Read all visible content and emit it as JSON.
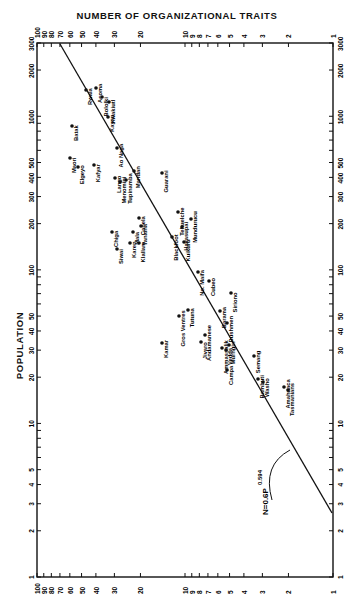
{
  "chart_data": {
    "type": "scatter",
    "title": "NUMBER OF ORGANIZATIONAL TRAITS",
    "xlabel": "NUMBER OF ORGANIZATIONAL TRAITS",
    "ylabel": "POPULATION",
    "x_scale": "log",
    "y_scale": "log",
    "x_axis_direction": "descending left-to-right",
    "xlim": [
      100,
      1
    ],
    "ylim": [
      1,
      3000
    ],
    "x_ticks": [
      100,
      90,
      80,
      70,
      60,
      50,
      40,
      30,
      20,
      10,
      9,
      8,
      7,
      6,
      5,
      4,
      3,
      2,
      1
    ],
    "y_ticks": [
      3000,
      2000,
      1000,
      900,
      800,
      700,
      600,
      500,
      400,
      300,
      200,
      100,
      90,
      80,
      70,
      60,
      50,
      40,
      30,
      20,
      10,
      9,
      8,
      7,
      6,
      5,
      4,
      3,
      2,
      1
    ],
    "grid": false,
    "regression": {
      "label": "N=0.6P^0.594",
      "equation_text": "N=0.6P",
      "exponent": "0.594"
    },
    "points": [
      {
        "name": "Batak",
        "px": 72,
        "py": 126
      },
      {
        "name": "Rwala",
        "px": 86,
        "py": 90
      },
      {
        "name": "Acoma",
        "px": 96,
        "py": 88
      },
      {
        "name": "Bololki",
        "px": 102,
        "py": 97
      },
      {
        "name": "Kwakiutl",
        "px": 109,
        "py": 102
      },
      {
        "name": "Kayan",
        "px": 108,
        "py": 117
      },
      {
        "name": "Maori",
        "px": 70,
        "py": 158
      },
      {
        "name": "Elgeyo",
        "px": 78,
        "py": 167
      },
      {
        "name": "Kafyar",
        "px": 94,
        "py": 165
      },
      {
        "name": "Ao Naga",
        "px": 117,
        "py": 148
      },
      {
        "name": "Mandan",
        "px": 134,
        "py": 171
      },
      {
        "name": "Lango",
        "px": 115,
        "py": 178
      },
      {
        "name": "Menomini",
        "px": 120,
        "py": 182
      },
      {
        "name": "Tupinamba",
        "px": 126,
        "py": 180
      },
      {
        "name": "Guarani",
        "px": 162,
        "py": 173
      },
      {
        "name": "Canela",
        "px": 139,
        "py": 218
      },
      {
        "name": "Chiga",
        "px": 112,
        "py": 232
      },
      {
        "name": "Siwai",
        "px": 117,
        "py": 249
      },
      {
        "name": "Mala",
        "px": 133,
        "py": 232
      },
      {
        "name": "Karen",
        "px": 130,
        "py": 243
      },
      {
        "name": "Klallam",
        "px": 139,
        "py": 243
      },
      {
        "name": "Tanaina",
        "px": 141,
        "py": 226
      },
      {
        "name": "Tehuelche",
        "px": 178,
        "py": 212
      },
      {
        "name": "Havasupai",
        "px": 182,
        "py": 227
      },
      {
        "name": "Mundurucu",
        "px": 191,
        "py": 219
      },
      {
        "name": "Kuikuru",
        "px": 184,
        "py": 242
      },
      {
        "name": "Blackfoot",
        "px": 172,
        "py": 237
      },
      {
        "name": "No. Maifa",
        "px": 198,
        "py": 272
      },
      {
        "name": "Cubeo",
        "px": 209,
        "py": 281
      },
      {
        "name": "Barama",
        "px": 220,
        "py": 311
      },
      {
        "name": "Siriono",
        "px": 231,
        "py": 293
      },
      {
        "name": "Bushmen",
        "px": 227,
        "py": 323
      },
      {
        "name": "Kamar",
        "px": 162,
        "py": 343
      },
      {
        "name": "Gros Ventres",
        "px": 179,
        "py": 316
      },
      {
        "name": "Tutuna",
        "px": 188,
        "py": 310
      },
      {
        "name": "Semang",
        "px": 254,
        "py": 356
      },
      {
        "name": "Bambuti",
        "px": 258,
        "py": 379
      },
      {
        "name": "Washo",
        "px": 263,
        "py": 382
      },
      {
        "name": "Amahuaca",
        "px": 284,
        "py": 387
      },
      {
        "name": "Tasmanians",
        "px": 288,
        "py": 390
      },
      {
        "name": "Andamanese",
        "px": 205,
        "py": 335
      },
      {
        "name": "Jivaro",
        "px": 201,
        "py": 342
      },
      {
        "name": "Ammassalik",
        "px": 222,
        "py": 348
      },
      {
        "name": "Vedda",
        "px": 226,
        "py": 350
      },
      {
        "name": "Murngin",
        "px": 229,
        "py": 345
      },
      {
        "name": "Campa",
        "px": 227,
        "py": 370
      }
    ]
  },
  "header": {
    "title": "NUMBER OF ORGANIZATIONAL TRAITS"
  },
  "axes": {
    "y_title": "POPULATION"
  }
}
